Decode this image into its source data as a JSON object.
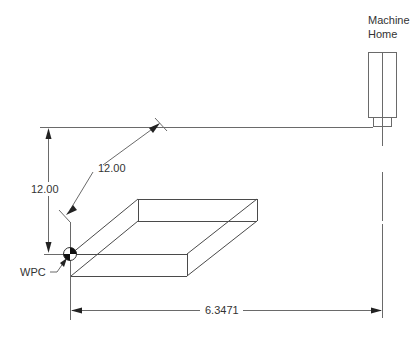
{
  "diagram": {
    "machine_home_label_line1": "Machine",
    "machine_home_label_line2": "Home",
    "diagonal_dimension": "12.00",
    "vertical_dimension": "12.00",
    "horizontal_dimension": "6.3471",
    "wpc_label": "WPC"
  }
}
